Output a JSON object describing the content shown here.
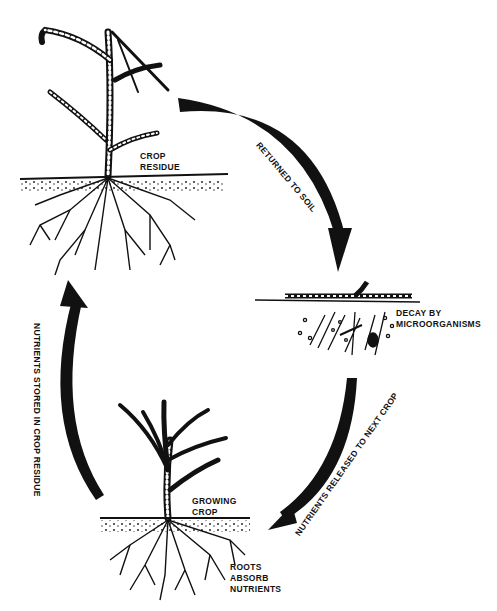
{
  "diagram": {
    "stages": [
      {
        "id": "crop-residue",
        "lines": [
          "CROP",
          "RESIDUE"
        ]
      },
      {
        "id": "decay",
        "lines": [
          "DECAY BY",
          "MICROORGANISMS"
        ]
      },
      {
        "id": "growing-crop",
        "lines": [
          "GROWING",
          "CROP"
        ]
      },
      {
        "id": "roots",
        "lines": [
          "ROOTS",
          "ABSORB",
          "NUTRIENTS"
        ]
      }
    ],
    "arrows": [
      {
        "id": "returned",
        "label": "RETURNED TO SOIL"
      },
      {
        "id": "released",
        "label": "NUTRIENTS RELEASED TO NEXT CROP"
      },
      {
        "id": "stored",
        "label": "NUTRIENTS STORED IN CROP RESIDUE"
      }
    ],
    "colors": {
      "ink": "#111111",
      "background": "#ffffff"
    }
  }
}
